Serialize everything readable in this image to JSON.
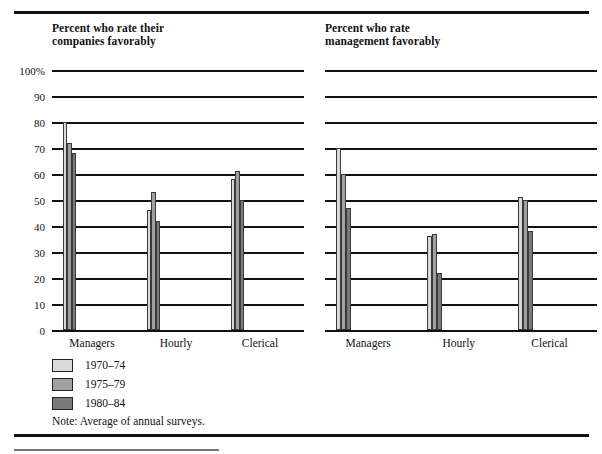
{
  "chart_data": [
    {
      "type": "bar",
      "title": "Percent who rate their\ncompanies favorably",
      "categories": [
        "Managers",
        "Hourly",
        "Clerical"
      ],
      "series": [
        {
          "name": "1970–74",
          "values": [
            80,
            46,
            58
          ],
          "color": "#d9d9d9"
        },
        {
          "name": "1975–79",
          "values": [
            72,
            53,
            61
          ],
          "color": "#a0a0a0"
        },
        {
          "name": "1980–84",
          "values": [
            68,
            42,
            50
          ],
          "color": "#7a7a7a"
        }
      ],
      "xlabel": "",
      "ylabel": "",
      "ylim": [
        0,
        100
      ],
      "yticks": [
        "100%",
        "90",
        "80",
        "70",
        "60",
        "50",
        "40",
        "30",
        "20",
        "10",
        "0"
      ],
      "ytick_values": [
        100,
        90,
        80,
        70,
        60,
        50,
        40,
        30,
        20,
        10,
        0
      ],
      "grid": true,
      "legend_position": "below-left"
    },
    {
      "type": "bar",
      "title": "Percent who rate\nmanagement favorably",
      "categories": [
        "Managers",
        "Hourly",
        "Clerical"
      ],
      "series": [
        {
          "name": "1970–74",
          "values": [
            70,
            36,
            51
          ],
          "color": "#d9d9d9"
        },
        {
          "name": "1975–79",
          "values": [
            60,
            37,
            50
          ],
          "color": "#a0a0a0"
        },
        {
          "name": "1980–84",
          "values": [
            47,
            22,
            38
          ],
          "color": "#7a7a7a"
        }
      ],
      "xlabel": "",
      "ylabel": "",
      "ylim": [
        0,
        100
      ],
      "yticks": [
        "100%",
        "90",
        "80",
        "70",
        "60",
        "50",
        "40",
        "30",
        "20",
        "10",
        "0"
      ],
      "ytick_values": [
        100,
        90,
        80,
        70,
        60,
        50,
        40,
        30,
        20,
        10,
        0
      ],
      "grid": true,
      "legend_position": "below-left"
    }
  ],
  "panels": {
    "left": {
      "title": "Percent who rate their\ncompanies favorably",
      "categories": [
        "Managers",
        "Hourly",
        "Clerical"
      ]
    },
    "right": {
      "title": "Percent who rate\nmanagement favorably",
      "categories": [
        "Managers",
        "Hourly",
        "Clerical"
      ]
    }
  },
  "axis": {
    "yticks": [
      "100%",
      "90",
      "80",
      "70",
      "60",
      "50",
      "40",
      "30",
      "20",
      "10",
      "0"
    ]
  },
  "legend": {
    "items": [
      {
        "label": "1970–74",
        "color": "#d9d9d9"
      },
      {
        "label": "1975–79",
        "color": "#a0a0a0"
      },
      {
        "label": "1980–84",
        "color": "#7a7a7a"
      }
    ]
  },
  "note": "Note: Average of annual surveys."
}
